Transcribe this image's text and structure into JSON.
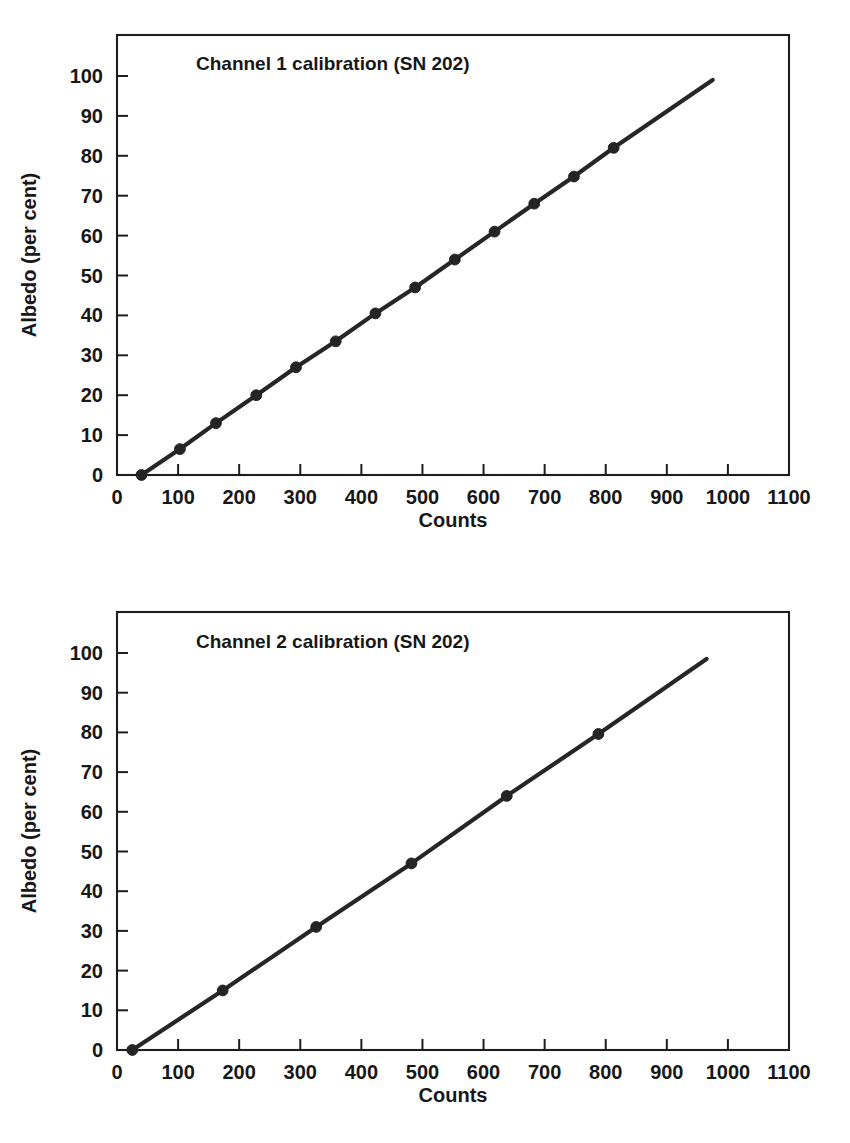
{
  "page": {
    "background_color": "#ffffff",
    "ink_color": "#1d1d1d",
    "marker_color": "#242424"
  },
  "chart_data": [
    {
      "type": "line",
      "title": "Channel 1 calibration (SN 202)",
      "xlabel": "Counts",
      "ylabel": "Albedo (per cent)",
      "xlim": [
        0,
        1100
      ],
      "ylim": [
        0,
        105
      ],
      "xticks": [
        0,
        100,
        200,
        300,
        400,
        500,
        600,
        700,
        800,
        900,
        1000,
        1100
      ],
      "yticks": [
        0,
        10,
        20,
        30,
        40,
        50,
        60,
        70,
        80,
        90,
        100
      ],
      "grid": false,
      "legend": "none",
      "marker": "filled-circle",
      "x": [
        40,
        103,
        162,
        228,
        293,
        358,
        423,
        488,
        553,
        618,
        683,
        748,
        813,
        975
      ],
      "y": [
        0,
        6.5,
        13,
        20,
        27,
        33.5,
        40.5,
        47,
        54,
        61,
        68,
        74.8,
        82,
        99
      ],
      "series": [
        {
          "name": "Channel 1 calibration",
          "points": [
            [
              40,
              0
            ],
            [
              103,
              6.5
            ],
            [
              162,
              13
            ],
            [
              228,
              20
            ],
            [
              293,
              27
            ],
            [
              358,
              33.5
            ],
            [
              423,
              40.5
            ],
            [
              488,
              47
            ],
            [
              553,
              54
            ],
            [
              618,
              61
            ],
            [
              683,
              68
            ],
            [
              748,
              74.8
            ],
            [
              813,
              82
            ],
            [
              975,
              99
            ]
          ]
        }
      ]
    },
    {
      "type": "line",
      "title": "Channel 2 calibration (SN 202)",
      "xlabel": "Counts",
      "ylabel": "Albedo (per cent)",
      "xlim": [
        0,
        1100
      ],
      "ylim": [
        0,
        105
      ],
      "xticks": [
        0,
        100,
        200,
        300,
        400,
        500,
        600,
        700,
        800,
        900,
        1000,
        1100
      ],
      "yticks": [
        0,
        10,
        20,
        30,
        40,
        50,
        60,
        70,
        80,
        90,
        100
      ],
      "grid": false,
      "legend": "none",
      "marker": "filled-circle",
      "x": [
        25,
        173,
        326,
        482,
        638,
        788,
        965
      ],
      "y": [
        0,
        15,
        31,
        47,
        64,
        79.6,
        98.5
      ],
      "series": [
        {
          "name": "Channel 2 calibration",
          "points": [
            [
              25,
              0
            ],
            [
              173,
              15
            ],
            [
              326,
              31
            ],
            [
              482,
              47
            ],
            [
              638,
              64
            ],
            [
              788,
              79.6
            ],
            [
              965,
              98.5
            ]
          ]
        }
      ]
    }
  ]
}
